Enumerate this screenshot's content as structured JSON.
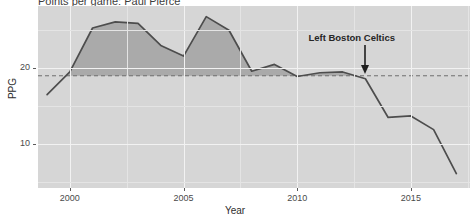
{
  "chart_data": {
    "type": "area",
    "title": "Points per game: Paul Pierce",
    "xlabel": "Year",
    "ylabel": "PPG",
    "xlim": [
      1998.6,
      2017.6
    ],
    "ylim": [
      4.2,
      28.2
    ],
    "grid": true,
    "legend": null,
    "x": [
      1999,
      2000,
      2001,
      2002,
      2003,
      2004,
      2005,
      2006,
      2007,
      2008,
      2009,
      2010,
      2011,
      2012,
      2013,
      2014,
      2015,
      2016,
      2017
    ],
    "values": [
      16.5,
      19.5,
      25.3,
      26.1,
      25.9,
      23.0,
      21.6,
      26.8,
      25.0,
      19.6,
      20.5,
      18.9,
      19.4,
      19.5,
      18.6,
      13.5,
      13.7,
      11.9,
      6.1
    ],
    "series": [
      {
        "name": "PPG",
        "values": [
          16.5,
          19.5,
          25.3,
          26.1,
          25.9,
          23.0,
          21.6,
          26.8,
          25.0,
          19.6,
          20.5,
          18.9,
          19.4,
          19.5,
          18.6,
          13.5,
          13.7,
          11.9,
          6.1
        ]
      }
    ],
    "reference_line": {
      "label": "career mean",
      "value": 19.0,
      "style": "dashed"
    },
    "shading": {
      "description": "area between series and reference line where series is above reference",
      "from_x": 1999.75,
      "to_x": 2013.2
    },
    "xticks": [
      2000,
      2005,
      2010,
      2015
    ],
    "xtick_labels": [
      "2000",
      "2005",
      "2010",
      "2015"
    ],
    "yticks": [
      10,
      20
    ],
    "ytick_labels": [
      "10",
      "20"
    ],
    "annotations": [
      {
        "text": "Left Boston Celtics",
        "x": 2013,
        "y": 19.0,
        "arrow": true,
        "arrow_direction": "down"
      }
    ],
    "colors": {
      "panel_background": "#d6d6d6",
      "grid_major": "#f2f2f2",
      "grid_minor": "#e4e4e4",
      "line": "#4d4d4d",
      "area_fill": "#a8a8a8",
      "reference_line": "#6e6e6e",
      "text": "#2e2e2e",
      "annotation": "#262626"
    }
  },
  "axes": {
    "y_title": "PPG",
    "x_title": "Year"
  }
}
